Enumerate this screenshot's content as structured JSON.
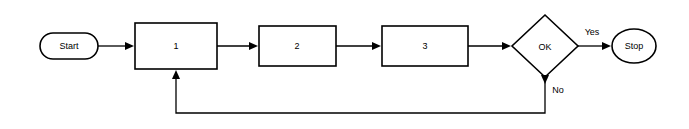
{
  "diagram": {
    "nodes": [
      {
        "id": "start",
        "label": "Start",
        "shape": "terminator"
      },
      {
        "id": "step1",
        "label": "1",
        "shape": "process"
      },
      {
        "id": "step2",
        "label": "2",
        "shape": "process"
      },
      {
        "id": "step3",
        "label": "3",
        "shape": "process"
      },
      {
        "id": "decision",
        "label": "OK",
        "shape": "diamond"
      },
      {
        "id": "stop",
        "label": "Stop",
        "shape": "terminator"
      }
    ],
    "edges": [
      {
        "from": "start",
        "to": "step1",
        "label": ""
      },
      {
        "from": "step1",
        "to": "step2",
        "label": ""
      },
      {
        "from": "step2",
        "to": "step3",
        "label": ""
      },
      {
        "from": "step3",
        "to": "decision",
        "label": ""
      },
      {
        "from": "decision",
        "to": "stop",
        "label": "Yes"
      },
      {
        "from": "decision",
        "to": "step1",
        "label": "No"
      }
    ],
    "colors": {
      "stroke": "#000000",
      "fill": "#ffffff",
      "background": "#ffffff"
    }
  }
}
